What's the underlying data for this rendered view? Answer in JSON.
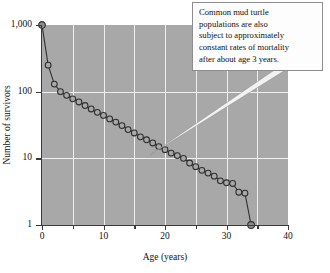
{
  "chart_data": {
    "type": "line",
    "title": "",
    "xlabel": "Age (years)",
    "ylabel": "Number of survivors",
    "xlim": [
      0,
      40
    ],
    "ylim": [
      1,
      1000
    ],
    "yscale": "log",
    "grid": true,
    "legend": null,
    "x_ticks": [
      0,
      10,
      20,
      30,
      40
    ],
    "x_tick_labels": [
      "0",
      "10",
      "20",
      "30",
      "40"
    ],
    "x_minor_ticks": [
      5,
      15,
      25,
      35
    ],
    "y_ticks": [
      1,
      10,
      100,
      1000
    ],
    "y_tick_labels": [
      "1",
      "10",
      "100",
      "1,000"
    ],
    "series": [
      {
        "name": "Common mud turtle survivorship",
        "marker": "open-circle",
        "x": [
          0,
          1,
          2,
          3,
          4,
          5,
          6,
          7,
          8,
          9,
          10,
          11,
          12,
          13,
          14,
          15,
          16,
          17,
          18,
          19,
          20,
          21,
          22,
          23,
          24,
          25,
          26,
          27,
          28,
          29,
          30,
          31,
          32,
          33,
          34
        ],
        "y": [
          1000,
          250,
          130,
          100,
          88,
          78,
          70,
          62,
          55,
          49,
          44,
          39,
          35,
          31,
          27,
          24,
          21,
          19,
          17,
          15,
          13.5,
          12,
          11,
          10,
          8.5,
          7.5,
          6.6,
          6.0,
          5.4,
          4.6,
          4.3,
          4.2,
          3.1,
          3.0,
          1
        ]
      }
    ],
    "annotations": [
      {
        "text": "Common mud turtle populations are also subject to approximately constant rates of mortality after about age 3 years.",
        "lines": [
          "Common mud turtle",
          "populations are also",
          "subject to approximately",
          "constant rates of mortality",
          "after about age 3 years."
        ],
        "points_to_x": 18,
        "points_to_y": 13
      }
    ],
    "colors": {
      "plot_background": "#a8a8a8",
      "gridline": "#efefef",
      "axis": "#3a3a3a",
      "marker_stroke": "#2e2e2e",
      "marker_fill": "#a8a8a8",
      "line": "#2e2e2e",
      "annotation_background": "#fdfdfd",
      "annotation_border": "#8d8d8d"
    }
  }
}
